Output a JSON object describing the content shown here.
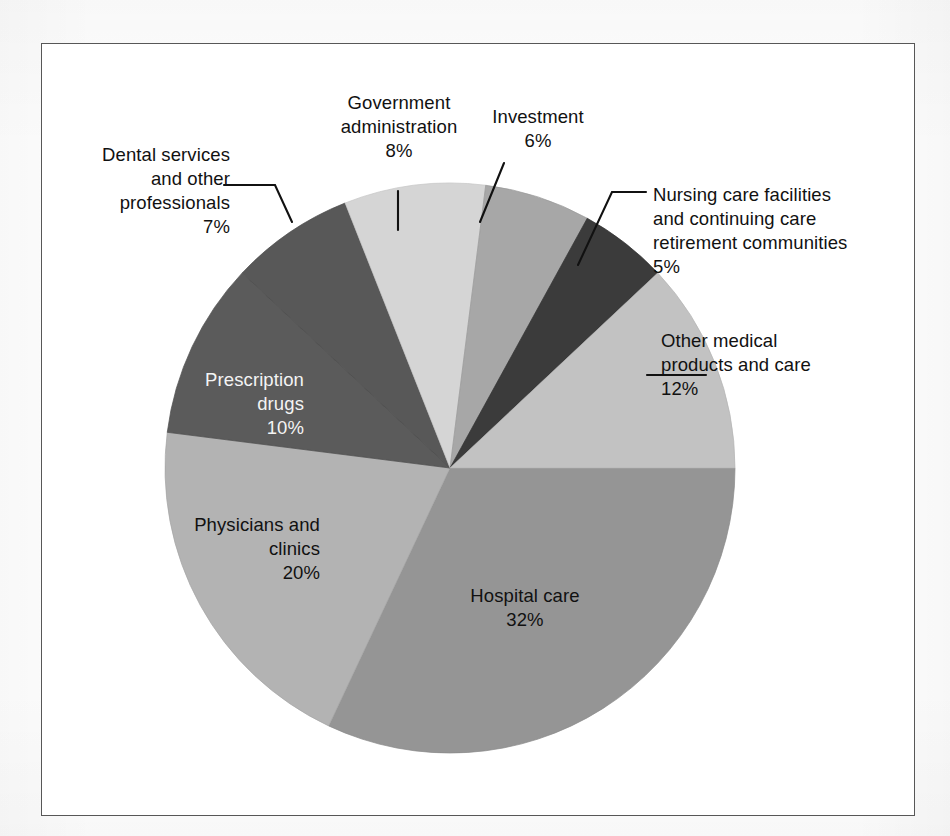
{
  "figure": {
    "background_color": "#ffffff",
    "frame_color": "#575757"
  },
  "chart_data": {
    "type": "pie",
    "title": "",
    "subtitle": "",
    "xlabel": "",
    "ylabel": "",
    "legend_position": "none",
    "grid": false,
    "units": "percent",
    "total": 100,
    "start_angle_deg": 0,
    "direction": "clockwise",
    "categories": [
      "Hospital care",
      "Physicians and clinics",
      "Prescription drugs",
      "Dental services and other professionals",
      "Government administration",
      "Investment",
      "Nursing care facilities and continuing care retirement communities",
      "Other medical products and care"
    ],
    "values": [
      32,
      20,
      10,
      7,
      8,
      6,
      5,
      12
    ],
    "colors": [
      "#959595",
      "#b3b3b3",
      "#5b5b5b",
      "#585858",
      "#d5d5d5",
      "#a7a7a7",
      "#3b3b3b",
      "#c2c2c2"
    ],
    "slices": [
      {
        "label": "Hospital care",
        "value": 32,
        "display_value": "32%",
        "color": "#959595",
        "label_placement": "inside",
        "label_color": "#111111",
        "label_align": "center",
        "label_lines": [
          "Hospital care",
          "32%"
        ]
      },
      {
        "label": "Physicians and clinics",
        "value": 20,
        "display_value": "20%",
        "color": "#b3b3b3",
        "label_placement": "inside",
        "label_color": "#111111",
        "label_align": "right",
        "label_lines": [
          "Physicians and",
          "clinics",
          "20%"
        ]
      },
      {
        "label": "Prescription drugs",
        "value": 10,
        "display_value": "10%",
        "color": "#5b5b5b",
        "label_placement": "inside",
        "label_color": "#f4f4f4",
        "label_align": "right",
        "label_lines": [
          "Prescription",
          "drugs",
          "10%"
        ]
      },
      {
        "label": "Dental services and other professionals",
        "value": 7,
        "display_value": "7%",
        "color": "#585858",
        "label_placement": "outside",
        "label_color": "#111111",
        "label_align": "right",
        "label_lines": [
          "Dental services",
          "and other",
          "professionals",
          "7%"
        ]
      },
      {
        "label": "Government administration",
        "value": 8,
        "display_value": "8%",
        "color": "#d5d5d5",
        "label_placement": "outside",
        "label_color": "#111111",
        "label_align": "center",
        "label_lines": [
          "Government",
          "administration",
          "8%"
        ]
      },
      {
        "label": "Investment",
        "value": 6,
        "display_value": "6%",
        "color": "#a7a7a7",
        "label_placement": "outside",
        "label_color": "#111111",
        "label_align": "center",
        "label_lines": [
          "Investment",
          "6%"
        ]
      },
      {
        "label": "Nursing care facilities and continuing care retirement communities",
        "value": 5,
        "display_value": "5%",
        "color": "#3b3b3b",
        "label_placement": "outside",
        "label_color": "#111111",
        "label_align": "left",
        "label_lines": [
          "Nursing care facilities",
          "and continuing care",
          "retirement communities",
          "5%"
        ]
      },
      {
        "label": "Other medical products and care",
        "value": 12,
        "display_value": "12%",
        "color": "#c2c2c2",
        "label_placement": "outside",
        "label_color": "#111111",
        "label_align": "left",
        "label_lines": [
          "Other medical",
          "products and care",
          "12%"
        ]
      }
    ]
  },
  "labels": {
    "hospital_care": "Hospital care\n32%",
    "physicians_clinics": "Physicians and\nclinics\n20%",
    "prescription_drugs": "Prescription\ndrugs\n10%",
    "dental_services": "Dental services\nand other\nprofessionals\n7%",
    "government_administration": "Government\nadministration\n8%",
    "investment": "Investment\n6%",
    "nursing_care": "Nursing care facilities\nand continuing care\nretirement communities\n5%",
    "other_medical": "Other medical\nproducts and care\n12%"
  }
}
